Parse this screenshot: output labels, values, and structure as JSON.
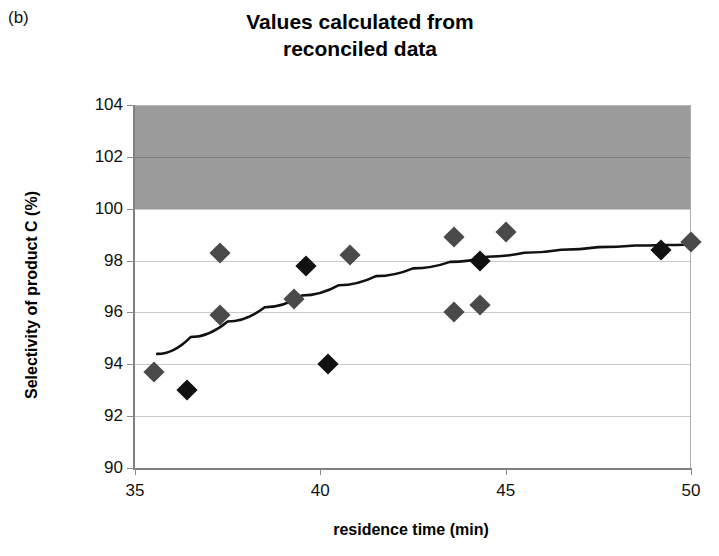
{
  "panel": {
    "label": "(b)"
  },
  "chart_data": {
    "type": "scatter",
    "title": "Values calculated from reconciled data",
    "title_lines": [
      "Values calculated from",
      "reconciled data"
    ],
    "xlabel": "residence time (min)",
    "ylabel": "Selectivity of product C (%)",
    "xlim": [
      35,
      50
    ],
    "ylim": [
      90,
      104
    ],
    "xticks": [
      35,
      40,
      45,
      50
    ],
    "yticks": [
      90,
      92,
      94,
      96,
      98,
      100,
      102,
      104
    ],
    "grid": true,
    "legend": null,
    "marker_shape": "diamond",
    "shaded_region": {
      "label": "infeasible region above 100%",
      "y_from": 100,
      "y_to": 104,
      "color": "#9b9b9b"
    },
    "series": [
      {
        "name": "Selectivity of product C",
        "marker": "diamond",
        "points": [
          {
            "x": 35.5,
            "y": 93.7,
            "shade": "gray"
          },
          {
            "x": 36.4,
            "y": 93.0,
            "shade": "dark"
          },
          {
            "x": 37.3,
            "y": 98.3,
            "shade": "gray"
          },
          {
            "x": 37.3,
            "y": 95.9,
            "shade": "gray"
          },
          {
            "x": 39.3,
            "y": 96.5,
            "shade": "gray"
          },
          {
            "x": 39.6,
            "y": 97.8,
            "shade": "dark"
          },
          {
            "x": 40.2,
            "y": 94.0,
            "shade": "dark"
          },
          {
            "x": 40.8,
            "y": 98.2,
            "shade": "gray"
          },
          {
            "x": 43.6,
            "y": 98.9,
            "shade": "gray"
          },
          {
            "x": 43.6,
            "y": 96.0,
            "shade": "gray"
          },
          {
            "x": 44.3,
            "y": 98.0,
            "shade": "dark"
          },
          {
            "x": 44.3,
            "y": 96.3,
            "shade": "gray"
          },
          {
            "x": 45.0,
            "y": 99.1,
            "shade": "gray"
          },
          {
            "x": 49.2,
            "y": 98.4,
            "shade": "dark"
          },
          {
            "x": 50.0,
            "y": 98.7,
            "shade": "gray"
          }
        ]
      }
    ],
    "trendline": {
      "name": "fitted curve",
      "color": "#111111",
      "points": [
        {
          "x": 35.6,
          "y": 94.4
        },
        {
          "x": 36.5,
          "y": 95.05
        },
        {
          "x": 37.5,
          "y": 95.65
        },
        {
          "x": 38.5,
          "y": 96.2
        },
        {
          "x": 39.5,
          "y": 96.65
        },
        {
          "x": 40.5,
          "y": 97.05
        },
        {
          "x": 41.5,
          "y": 97.4
        },
        {
          "x": 42.5,
          "y": 97.7
        },
        {
          "x": 43.5,
          "y": 97.95
        },
        {
          "x": 44.5,
          "y": 98.15
        },
        {
          "x": 45.5,
          "y": 98.3
        },
        {
          "x": 46.5,
          "y": 98.42
        },
        {
          "x": 47.5,
          "y": 98.52
        },
        {
          "x": 48.5,
          "y": 98.58
        },
        {
          "x": 49.2,
          "y": 98.6
        },
        {
          "x": 50.0,
          "y": 98.62
        }
      ]
    }
  }
}
